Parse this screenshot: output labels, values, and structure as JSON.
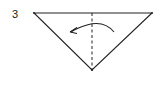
{
  "diagram": {
    "type": "origami-fold-step",
    "step_number": "3",
    "shape": "triangle",
    "fold_line": "vertical-dashed-center",
    "arrow_direction": "right-to-left"
  }
}
